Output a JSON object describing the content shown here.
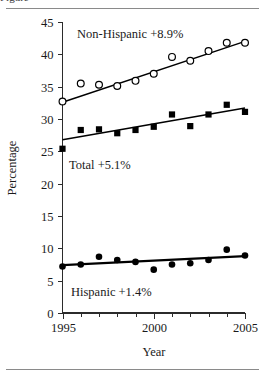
{
  "figure": {
    "cut_off_caption_above": "Figure",
    "background_color": "#ffffff",
    "rule_color": "#8a8a8a"
  },
  "chart_data": {
    "type": "scatter",
    "title": "",
    "subtitle": "",
    "xlabel": "Year",
    "ylabel": "Percentage",
    "xlim": [
      1995,
      2005
    ],
    "ylim": [
      0,
      45
    ],
    "grid": false,
    "legend_position": "inline-annotations",
    "x_ticks_major": [
      1995,
      2000,
      2005
    ],
    "x_tick_labels": [
      "1995",
      "2000",
      "2005"
    ],
    "x_ticks_minor": [
      1996,
      1997,
      1998,
      1999,
      2001,
      2002,
      2003,
      2004
    ],
    "y_ticks": [
      0,
      5,
      10,
      15,
      20,
      25,
      30,
      35,
      40,
      45
    ],
    "y_tick_labels": [
      "0",
      "5",
      "10",
      "15",
      "20",
      "25",
      "30",
      "35",
      "40",
      "45"
    ],
    "x": [
      1995,
      1996,
      1997,
      1998,
      1999,
      2000,
      2001,
      2002,
      2003,
      2004,
      2005
    ],
    "series": [
      {
        "name": "Non-Hispanic",
        "marker": "open-circle",
        "annotation": "Non-Hispanic +8.9%",
        "change": "+8.9%",
        "values": [
          32.7,
          35.5,
          35.3,
          35.1,
          35.9,
          37.0,
          39.6,
          39.0,
          40.5,
          41.8,
          41.8
        ],
        "trend_start": [
          1995,
          32.6
        ],
        "trend_end": [
          2005,
          42.0
        ]
      },
      {
        "name": "Total",
        "marker": "filled-square",
        "annotation": "Total +5.1%",
        "change": "+5.1%",
        "values": [
          25.4,
          28.3,
          28.4,
          27.8,
          28.3,
          28.8,
          30.7,
          28.9,
          30.7,
          32.2,
          31.1
        ],
        "trend_start": [
          1995,
          26.8
        ],
        "trend_end": [
          2005,
          31.7
        ]
      },
      {
        "name": "Hispanic",
        "marker": "filled-circle",
        "annotation": "Hispanic +1.4%",
        "change": "+1.4%",
        "values": [
          7.2,
          7.5,
          8.7,
          8.2,
          7.9,
          6.7,
          7.5,
          7.7,
          8.2,
          9.8,
          8.9
        ],
        "trend_start": [
          1995,
          7.4
        ],
        "trend_end": [
          2005,
          8.8
        ]
      }
    ]
  }
}
